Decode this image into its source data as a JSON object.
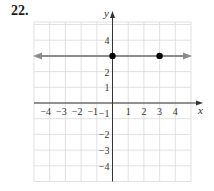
{
  "problem_number": "22.",
  "chart_data": {
    "type": "line",
    "title": "",
    "xlabel": "x",
    "ylabel": "y",
    "xlim": [
      -5,
      5
    ],
    "ylim": [
      -5,
      5.5
    ],
    "grid": true,
    "x_tick_labels": [
      "−4",
      "−3",
      "−2",
      "−1",
      "1",
      "2",
      "3",
      "4"
    ],
    "y_tick_labels": [
      "4",
      "2",
      "1",
      "−1",
      "−2",
      "−3",
      "−4"
    ],
    "series": [
      {
        "name": "y = 3",
        "kind": "horizontal-line-with-arrows",
        "equation": "y = 3",
        "color": "#8c8c8c",
        "points": [
          {
            "x": 0,
            "y": 3
          },
          {
            "x": 3,
            "y": 3
          }
        ]
      }
    ],
    "point_color": "#000000",
    "axis_color": "#333333",
    "grid_color": "#d9d9d9"
  }
}
